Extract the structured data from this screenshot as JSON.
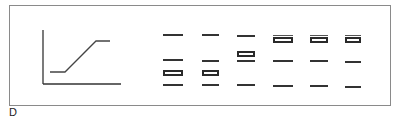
{
  "figure": {
    "panel_label": "D",
    "graph": {
      "description": "schematic step curve: low plateau, linear rise, high plateau",
      "points": [
        [
          50,
          72
        ],
        [
          65,
          72
        ],
        [
          96,
          41
        ],
        [
          110,
          41
        ]
      ]
    },
    "lanes": [
      {
        "x": 163,
        "w": 20,
        "bands": [
          35,
          60,
          85
        ],
        "box": 73,
        "box_top_line": false
      },
      {
        "x": 202,
        "w": 17,
        "bands": [
          35,
          61,
          85
        ],
        "box": 73,
        "box_top_line": false
      },
      {
        "x": 237,
        "w": 18,
        "bands": [
          36,
          61,
          85
        ],
        "box": 54,
        "box_top_line": false
      },
      {
        "x": 273,
        "w": 20,
        "bands": [
          61,
          86
        ],
        "box": 40,
        "box_top_line": true
      },
      {
        "x": 310,
        "w": 18,
        "bands": [
          61,
          86
        ],
        "box": 40,
        "box_top_line": true
      },
      {
        "x": 345,
        "w": 16,
        "bands": [
          62,
          87
        ],
        "box": 40,
        "box_top_line": true
      }
    ]
  }
}
